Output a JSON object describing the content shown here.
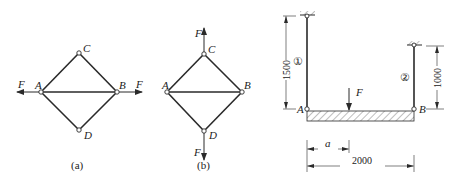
{
  "figures": [
    {
      "id": "a",
      "caption": "(a)",
      "nodes": {
        "A": "A",
        "B": "B",
        "C": "C",
        "D": "D"
      },
      "loads": {
        "left": "F",
        "right": "F"
      }
    },
    {
      "id": "b",
      "caption": "(b)",
      "nodes": {
        "A": "A",
        "B": "B",
        "C": "C",
        "D": "D"
      },
      "loads": {
        "top": "F",
        "bottom": "F"
      }
    },
    {
      "id": "beam",
      "nodes": {
        "A": "A",
        "B": "B"
      },
      "rods": {
        "rod1": "①",
        "rod2": "②"
      },
      "load": "F",
      "dimensions": {
        "rod1_length": "1500",
        "rod2_length": "1000",
        "a": "a",
        "span": "2000"
      }
    }
  ],
  "colors": {
    "line": "#2a2a2a",
    "background": "#ffffff"
  }
}
